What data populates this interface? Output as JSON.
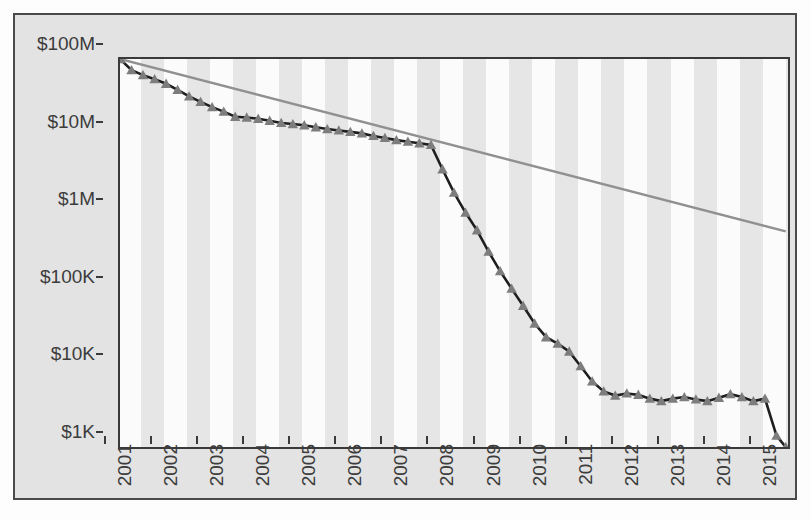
{
  "chart_data": {
    "type": "line",
    "title": "",
    "subtitle": "",
    "xlabel": "",
    "ylabel": "",
    "yscale": "log",
    "ylim": [
      1000,
      100000000
    ],
    "xlim": [
      2001,
      2015.5
    ],
    "grid": false,
    "legend_position": "none",
    "y_tick_labels": [
      "$100M",
      "$10M",
      "$1M",
      "$100K",
      "$10K",
      "$1K"
    ],
    "y_tick_values": [
      100000000,
      10000000,
      1000000,
      100000,
      10000,
      1000
    ],
    "x_tick_labels": [
      "2001",
      "2002",
      "2003",
      "2004",
      "2005",
      "2006",
      "2007",
      "2008",
      "2009",
      "2010",
      "2011",
      "2012",
      "2013",
      "2014",
      "2015"
    ],
    "x_tick_values": [
      2001,
      2002,
      2003,
      2004,
      2005,
      2006,
      2007,
      2008,
      2009,
      2010,
      2011,
      2012,
      2013,
      2014,
      2015
    ],
    "series": [
      {
        "name": "data",
        "marker": "triangle",
        "color": "#7d7d7d",
        "line_color": "#1e1e1e",
        "x": [
          2001.0,
          2001.25,
          2001.5,
          2001.75,
          2002.0,
          2002.25,
          2002.5,
          2002.75,
          2003.0,
          2003.25,
          2003.5,
          2003.75,
          2004.0,
          2004.25,
          2004.5,
          2004.75,
          2005.0,
          2005.25,
          2005.5,
          2005.75,
          2006.0,
          2006.25,
          2006.5,
          2006.75,
          2007.0,
          2007.25,
          2007.5,
          2007.75,
          2008.0,
          2008.25,
          2008.5,
          2008.75,
          2009.0,
          2009.25,
          2009.5,
          2009.75,
          2010.0,
          2010.25,
          2010.5,
          2010.75,
          2011.0,
          2011.25,
          2011.5,
          2011.75,
          2012.0,
          2012.25,
          2012.5,
          2012.75,
          2013.0,
          2013.25,
          2013.5,
          2013.75,
          2014.0,
          2014.25,
          2014.5,
          2014.75,
          2015.0,
          2015.25,
          2015.45
        ],
        "y": [
          100000000,
          72000000,
          62000000,
          55000000,
          48000000,
          40000000,
          33000000,
          28000000,
          24000000,
          21000000,
          18000000,
          17600000,
          17000000,
          16000000,
          15000000,
          14500000,
          14000000,
          13200000,
          12500000,
          12000000,
          11500000,
          11000000,
          10200000,
          9600000,
          9000000,
          8600000,
          8200000,
          7800000,
          3800000,
          1900000,
          1050000,
          620000,
          330000,
          185000,
          110000,
          66000,
          39000,
          26000,
          21500,
          17000,
          11000,
          7000,
          5200,
          4600,
          4900,
          4700,
          4200,
          3900,
          4200,
          4400,
          4100,
          3900,
          4300,
          4800,
          4400,
          3900,
          4200,
          1400,
          1000
        ]
      },
      {
        "name": "reference-trend",
        "marker": "none",
        "color": "#909090",
        "line_color": "#909090",
        "x": [
          2001.0,
          2015.45
        ],
        "y": [
          100000000,
          600000
        ]
      }
    ]
  },
  "axes": {
    "y_ticks": [
      {
        "label": "$100M",
        "value": 100000000
      },
      {
        "label": "$10M",
        "value": 10000000
      },
      {
        "label": "$1M",
        "value": 1000000
      },
      {
        "label": "$100K",
        "value": 100000
      },
      {
        "label": "$10K",
        "value": 10000
      },
      {
        "label": "$1K",
        "value": 1000
      }
    ],
    "x_ticks": [
      {
        "label": "2001",
        "value": 2001
      },
      {
        "label": "2002",
        "value": 2002
      },
      {
        "label": "2003",
        "value": 2003
      },
      {
        "label": "2004",
        "value": 2004
      },
      {
        "label": "2005",
        "value": 2005
      },
      {
        "label": "2006",
        "value": 2006
      },
      {
        "label": "2007",
        "value": 2007
      },
      {
        "label": "2008",
        "value": 2008
      },
      {
        "label": "2009",
        "value": 2009
      },
      {
        "label": "2010",
        "value": 2010
      },
      {
        "label": "2011",
        "value": 2011
      },
      {
        "label": "2012",
        "value": 2012
      },
      {
        "label": "2013",
        "value": 2013
      },
      {
        "label": "2014",
        "value": 2014
      },
      {
        "label": "2015",
        "value": 2015
      }
    ]
  },
  "colors": {
    "panel_background": "#e3e3e3",
    "panel_border": "#4a4a4a",
    "plot_background": "#fbfbfb",
    "band": "#e6e6e6",
    "axis": "#3a3a3a",
    "series_line": "#1e1e1e",
    "series_marker": "#7d7d7d",
    "reference_line": "#909090",
    "text": "#3c3c3c"
  }
}
